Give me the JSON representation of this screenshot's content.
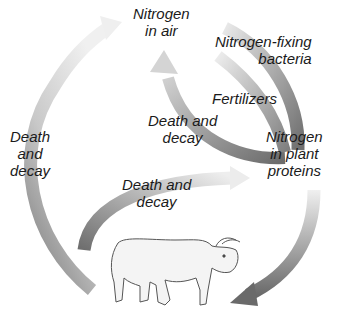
{
  "diagram": {
    "type": "nitrogen-cycle",
    "nodes": {
      "air": "Nitrogen in air",
      "plants": "Nitrogen in plant proteins",
      "animal": "cow-illustration"
    },
    "labels": {
      "nitrogen_air": [
        "Nitrogen",
        "in air"
      ],
      "nitrogen_fixing": [
        "Nitrogen-fixing",
        "bacteria"
      ],
      "fertilizers": "Fertilizers",
      "death_decay_mid": [
        "Death and",
        "decay"
      ],
      "nitrogen_plant": [
        "Nitrogen",
        "in plant",
        "proteins"
      ],
      "death_decay_left": [
        "Death",
        "and",
        "decay"
      ],
      "death_decay_lower": [
        "Death and",
        "decay"
      ]
    },
    "arrows": [
      {
        "from": "animal",
        "to": "air",
        "label": "Death and decay (left)"
      },
      {
        "from": "air",
        "to": "plants",
        "label": "Nitrogen-fixing bacteria"
      },
      {
        "from": "fertilizers",
        "to": "plants",
        "label": "Fertilizers"
      },
      {
        "from": "plants",
        "to": "air",
        "label": "Death and decay (middle)"
      },
      {
        "from": "animal",
        "to": "plants",
        "label": "Death and decay (lower)"
      },
      {
        "from": "plants",
        "to": "animal",
        "label": "eaten"
      }
    ],
    "colors": {
      "arrow_dark": "#7a7a7a",
      "arrow_light": "#e2e2e2",
      "text": "#1a1a1a"
    }
  }
}
